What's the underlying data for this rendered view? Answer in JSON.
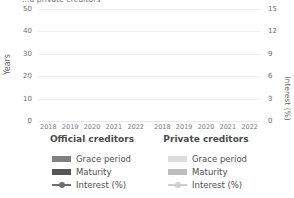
{
  "title": "...d private creditors",
  "panels": [
    {
      "caption": "Official creditors"
    },
    {
      "caption": "Private creditors"
    }
  ],
  "axes": {
    "left": {
      "title": "Years",
      "ticks": [
        "0",
        "10",
        "20",
        "30",
        "40",
        "50"
      ]
    },
    "right": {
      "title": "Interest (%)",
      "ticks": [
        "0",
        "3",
        "6",
        "9",
        "12",
        "15"
      ]
    },
    "x": {
      "ticks": [
        "2018",
        "2019",
        "2020",
        "2021",
        "2022"
      ]
    }
  },
  "legends": {
    "official": [
      {
        "label": "Grace period",
        "type": "bar",
        "color": "#808080"
      },
      {
        "label": "Maturity",
        "type": "bar",
        "color": "#555555"
      },
      {
        "label": "Interest (%)",
        "type": "line",
        "color": "#6e6e6e"
      }
    ],
    "private": [
      {
        "label": "Grace period",
        "type": "bar",
        "color": "#dcdcdc"
      },
      {
        "label": "Maturity",
        "type": "bar",
        "color": "#bdbdbd"
      },
      {
        "label": "Interest (%)",
        "type": "line",
        "color": "#cfcfcf"
      }
    ]
  },
  "colors": {
    "gridline": "#eceef0",
    "baseline": "#e6e8ea",
    "text": "#5a5a5a",
    "background": "#ffffff"
  },
  "chart_data": {
    "type": "bar",
    "title": "...d private creditors",
    "xlabel": "",
    "ylabel": "Years",
    "y2label": "Interest (%)",
    "ylim": [
      0,
      50
    ],
    "y2lim": [
      0,
      15
    ],
    "yticks": [
      0,
      10,
      20,
      30,
      40,
      50
    ],
    "y2ticks": [
      0,
      3,
      6,
      9,
      12,
      15
    ],
    "grid": true,
    "legend_position": "bottom",
    "categories": [
      "2018",
      "2019",
      "2020",
      "2021",
      "2022"
    ],
    "panels": [
      {
        "name": "Official creditors",
        "series": [
          {
            "name": "Grace period",
            "type": "bar",
            "axis": "left",
            "values": [
              null,
              null,
              null,
              null,
              null
            ]
          },
          {
            "name": "Maturity",
            "type": "bar",
            "axis": "left",
            "values": [
              null,
              null,
              null,
              null,
              null
            ]
          },
          {
            "name": "Interest (%)",
            "type": "line",
            "axis": "right",
            "values": [
              null,
              null,
              null,
              null,
              null
            ]
          }
        ]
      },
      {
        "name": "Private creditors",
        "series": [
          {
            "name": "Grace period",
            "type": "bar",
            "axis": "left",
            "values": [
              null,
              null,
              null,
              null,
              null
            ]
          },
          {
            "name": "Maturity",
            "type": "bar",
            "axis": "left",
            "values": [
              null,
              null,
              null,
              null,
              null
            ]
          },
          {
            "name": "Interest (%)",
            "type": "line",
            "axis": "right",
            "values": [
              null,
              null,
              null,
              null,
              null
            ]
          }
        ]
      }
    ],
    "note": "Plot area rendered empty in the screenshot: only gridlines and axes are visible, no bar or line data is drawn."
  }
}
